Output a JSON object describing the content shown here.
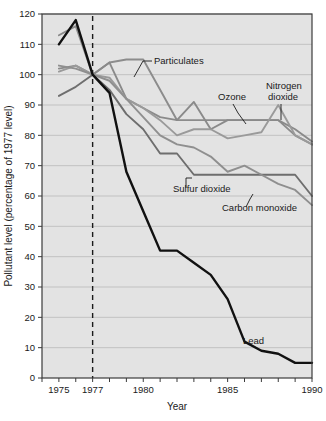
{
  "chart_data": {
    "type": "line",
    "title": "",
    "xlabel": "Year",
    "ylabel": "Pollutant level (percentage of 1977 level)",
    "xlim": [
      1974,
      1990
    ],
    "ylim": [
      0,
      120
    ],
    "ytick_step": 10,
    "yticks": [
      0,
      10,
      20,
      30,
      40,
      50,
      60,
      70,
      80,
      90,
      100,
      110,
      120
    ],
    "ytick_labels": [
      "0",
      "10",
      "20",
      "30",
      "40",
      "50",
      "60",
      "70",
      "80",
      "90",
      "100",
      "110",
      "120"
    ],
    "xticks": [
      1974,
      1975,
      1976,
      1977,
      1978,
      1979,
      1980,
      1981,
      1982,
      1983,
      1984,
      1985,
      1986,
      1987,
      1988,
      1989,
      1990
    ],
    "xtick_labels_shown": [
      "1975",
      "1977",
      "1980",
      "1985",
      "1990"
    ],
    "xtick_labels_shown_values": [
      1975,
      1977,
      1980,
      1985,
      1990
    ],
    "grid": "horizontal",
    "legend_position": "inline-annotations",
    "reference_line": {
      "x": 1977,
      "style": "dashed",
      "label": ""
    },
    "x": [
      1975,
      1976,
      1977,
      1978,
      1979,
      1980,
      1981,
      1982,
      1983,
      1984,
      1985,
      1986,
      1987,
      1988,
      1989,
      1990
    ],
    "series": [
      {
        "name": "Particulates",
        "color": "#8c8c8c",
        "values": [
          113,
          116,
          100,
          104,
          105,
          105,
          95,
          85,
          85,
          85,
          85,
          85,
          85,
          85,
          80,
          77
        ]
      },
      {
        "name": "Ozone",
        "color": "#8a8a8a",
        "values": [
          102,
          103,
          100,
          104,
          92,
          89,
          86,
          85,
          91,
          82,
          85,
          85,
          85,
          85,
          82,
          78
        ]
      },
      {
        "name": "Nitrogen dioxide",
        "color": "#9a9a9a",
        "values": [
          101,
          103,
          100,
          99,
          92,
          89,
          85,
          80,
          82,
          82,
          79,
          80,
          81,
          90,
          80,
          77
        ]
      },
      {
        "name": "Sulfur dioxide",
        "color": "#6e6e6e",
        "values": [
          93,
          96,
          100,
          95,
          87,
          82,
          74,
          74,
          67,
          67,
          67,
          67,
          67,
          67,
          67,
          60
        ]
      },
      {
        "name": "Carbon monoxide",
        "color": "#8f8f8f",
        "values": [
          103,
          102,
          100,
          98,
          92,
          86,
          80,
          77,
          76,
          73,
          68,
          70,
          67,
          64,
          62,
          57
        ]
      },
      {
        "name": "Lead",
        "color": "#111111",
        "values": [
          110,
          118,
          100,
          94,
          68,
          55,
          42,
          42,
          38,
          34,
          26,
          12,
          9,
          8,
          5,
          5
        ]
      }
    ],
    "annotations": [
      {
        "text": "Particulates",
        "series": "Particulates"
      },
      {
        "text": "Ozone",
        "series": "Ozone"
      },
      {
        "text": "Nitrogen dioxide",
        "series": "Nitrogen dioxide",
        "line1": "Nitrogen",
        "line2": "dioxide"
      },
      {
        "text": "Sulfur dioxide",
        "series": "Sulfur dioxide"
      },
      {
        "text": "Carbon monoxide",
        "series": "Carbon monoxide"
      },
      {
        "text": "Lead",
        "series": "Lead"
      }
    ]
  },
  "axes": {
    "x_title": "Year",
    "y_title": "Pollutant level (percentage of 1977 level)"
  },
  "colors": {
    "plot_background": "#e3e3e3",
    "grid": "#b9b9b9",
    "axis": "#3b3b3b",
    "lead": "#111111",
    "gray_series": "#8c8c8c"
  }
}
